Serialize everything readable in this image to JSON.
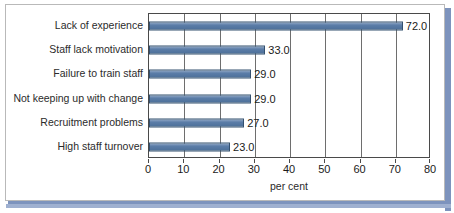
{
  "chart_data": {
    "type": "bar",
    "orientation": "horizontal",
    "title": "",
    "xlabel": "per cent",
    "ylabel": "",
    "xlim": [
      0,
      80
    ],
    "xticks": [
      0,
      10,
      20,
      30,
      40,
      50,
      60,
      70,
      80
    ],
    "grid": true,
    "grid_axis": "x",
    "legend": false,
    "categories": [
      "Lack of experience",
      "Staff lack motivation",
      "Failure to train staff",
      "Not keeping up with change",
      "Recruitment problems",
      "High staff turnover"
    ],
    "values": [
      72.0,
      33.0,
      29.0,
      29.0,
      27.0,
      23.0
    ],
    "value_labels": [
      "72.0",
      "33.0",
      "29.0",
      "29.0",
      "27.0",
      "23.0"
    ],
    "bar_color": "#5b7da8",
    "bar_edge_color": "#33506f",
    "plot_background": "#ffffff"
  },
  "frame": {
    "border_color": "#b9b9b9",
    "shadow_color": "#7d93bd",
    "background": "#ffffff"
  }
}
